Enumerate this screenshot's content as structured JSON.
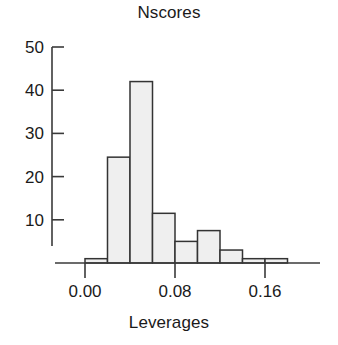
{
  "chart_data": {
    "type": "bar",
    "title": "Nscores",
    "subtitle": "",
    "xlabel": "Leverages",
    "ylabel": "",
    "bin_width": 0.02,
    "bin_edges": [
      0.0,
      0.02,
      0.04,
      0.06,
      0.08,
      0.1,
      0.12,
      0.14,
      0.16,
      0.18
    ],
    "categories": [
      "0.00-0.02",
      "0.02-0.04",
      "0.04-0.06",
      "0.06-0.08",
      "0.08-0.10",
      "0.10-0.12",
      "0.12-0.14",
      "0.14-0.16",
      "0.16-0.18"
    ],
    "values": [
      1,
      24.5,
      42,
      11.5,
      5,
      7.5,
      3,
      1,
      1
    ],
    "xlim": [
      0.0,
      0.18
    ],
    "ylim": [
      0,
      50
    ],
    "xticks": [
      0.0,
      0.08,
      0.16
    ],
    "xtick_labels": [
      "0.00",
      "0.08",
      "0.16"
    ],
    "yticks": [
      10,
      20,
      30,
      40,
      50
    ],
    "ytick_labels": [
      "10",
      "20",
      "30",
      "40",
      "50"
    ],
    "grid": false,
    "legend": null,
    "bar_fill_color": "#efefef",
    "bar_edge_color": "#333333",
    "axis_color": "#3a3a3a",
    "background_color": "#ffffff"
  },
  "labels": {
    "title": "Nscores",
    "xaxis_title": "Leverages"
  }
}
